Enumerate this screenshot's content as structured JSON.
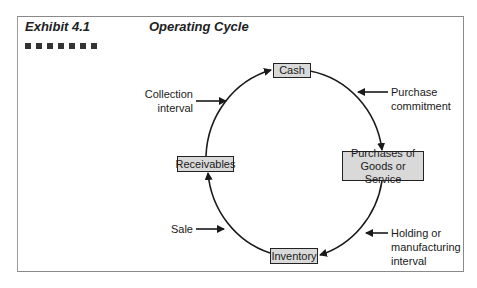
{
  "header": {
    "exhibit_label": "Exhibit 4.1",
    "title": "Operating Cycle",
    "decoration_square_count": 7
  },
  "nodes": {
    "cash": "Cash",
    "purchases_line1": "Purchases of",
    "purchases_line2": "Goods or Service",
    "inventory": "Inventory",
    "receivables": "Receivables"
  },
  "annotations": {
    "collection_line1": "Collection",
    "collection_line2": "interval",
    "purchase_line1": "Purchase",
    "purchase_line2": "commitment",
    "holding_line1": "Holding or",
    "holding_line2": "manufacturing",
    "holding_line3": "interval",
    "sale": "Sale"
  },
  "colors": {
    "box_fill": "#d9d9d9",
    "line": "#1a1a1a",
    "frame": "#8a8a8a"
  }
}
